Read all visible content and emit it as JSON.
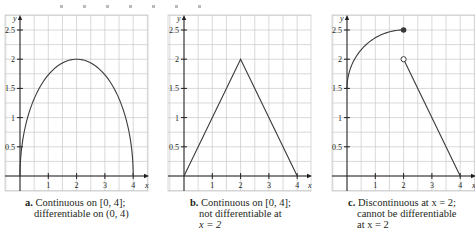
{
  "figure": {
    "axis_labels": {
      "x": "x",
      "y": "y"
    },
    "y_ticks": [
      "0.5",
      "1",
      "1.5",
      "2",
      "2.5"
    ],
    "x_ticks": [
      "1",
      "2",
      "3",
      "4"
    ],
    "colors": {
      "grid": "#c9c9c9",
      "axis": "#231f20",
      "curve": "#3a3a3a"
    }
  },
  "panels": [
    {
      "id": "a",
      "label": "a.",
      "caption_line1": "Continuous on [0, 4];",
      "caption_line2": "differentiable on (0, 4)",
      "caption_line3": ""
    },
    {
      "id": "b",
      "label": "b.",
      "caption_line1": "Continuous on [0, 4];",
      "caption_line2": "not differentiable at",
      "caption_line3": "x = 2"
    },
    {
      "id": "c",
      "label": "c.",
      "caption_line1": "Discontinuous at x = 2;",
      "caption_line2": "cannot be differentiable",
      "caption_line3": "at x = 2"
    }
  ],
  "chart_data": [
    {
      "type": "line",
      "title": "a. Continuous on [0, 4]; differentiable on (0, 4)",
      "xlabel": "x",
      "ylabel": "y",
      "xlim": [
        -0.5,
        4.5
      ],
      "ylim": [
        -0.5,
        2.75
      ],
      "grid": true,
      "x_ticks": [
        1,
        2,
        3,
        4
      ],
      "y_ticks": [
        0.5,
        1,
        1.5,
        2,
        2.5
      ],
      "series": [
        {
          "name": "semicircle y = sqrt(4 - (x-2)^2)",
          "x": [
            0,
            0.1,
            0.25,
            0.5,
            1,
            1.5,
            2,
            2.5,
            3,
            3.5,
            3.75,
            3.9,
            4
          ],
          "y": [
            0,
            0.62,
            0.97,
            1.32,
            1.73,
            1.94,
            2,
            1.94,
            1.73,
            1.32,
            0.97,
            0.62,
            0
          ]
        }
      ]
    },
    {
      "type": "line",
      "title": "b. Continuous on [0, 4]; not differentiable at x = 2",
      "xlabel": "x",
      "ylabel": "y",
      "xlim": [
        -0.5,
        4.5
      ],
      "ylim": [
        -0.5,
        2.75
      ],
      "grid": true,
      "x_ticks": [
        1,
        2,
        3,
        4
      ],
      "y_ticks": [
        0.5,
        1,
        1.5,
        2,
        2.5
      ],
      "series": [
        {
          "name": "tent function",
          "x": [
            0,
            2,
            4
          ],
          "y": [
            0,
            2,
            0
          ]
        }
      ]
    },
    {
      "type": "line",
      "title": "c. Discontinuous at x = 2; cannot be differentiable at x = 2",
      "xlabel": "x",
      "ylabel": "y",
      "xlim": [
        -0.5,
        4.5
      ],
      "ylim": [
        -0.5,
        2.75
      ],
      "grid": true,
      "x_ticks": [
        1,
        2,
        3,
        4
      ],
      "y_ticks": [
        0.5,
        1,
        1.5,
        2,
        2.5
      ],
      "series": [
        {
          "name": "left piece (concave arc)",
          "x": [
            0,
            0.1,
            0.25,
            0.5,
            0.75,
            1,
            1.25,
            1.5,
            1.75,
            2
          ],
          "y": [
            1.5,
            1.69,
            1.85,
            2.05,
            2.2,
            2.32,
            2.41,
            2.47,
            2.49,
            2.5
          ],
          "endpoint": {
            "x": 2,
            "y": 2.5,
            "marker": "filled"
          }
        },
        {
          "name": "right piece (line)",
          "x": [
            2,
            4
          ],
          "y": [
            2,
            0
          ],
          "startpoint": {
            "x": 2,
            "y": 2,
            "marker": "open"
          }
        }
      ]
    }
  ]
}
